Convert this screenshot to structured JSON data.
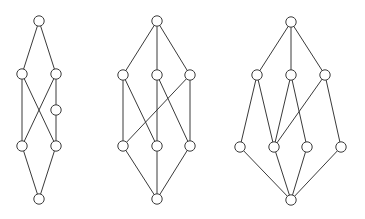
{
  "figure": {
    "node_radius": 5.2,
    "stroke_color": "#3a3a3a",
    "node_fill": "#ffffff",
    "background": "#ffffff"
  },
  "diagrams": [
    {
      "id": "lattice-1",
      "nodes": [
        {
          "id": "top",
          "x": 39,
          "y": 21
        },
        {
          "id": "a",
          "x": 22,
          "y": 74
        },
        {
          "id": "b",
          "x": 56,
          "y": 74
        },
        {
          "id": "c",
          "x": 56,
          "y": 110
        },
        {
          "id": "d",
          "x": 22,
          "y": 146
        },
        {
          "id": "e",
          "x": 56,
          "y": 146
        },
        {
          "id": "bottom",
          "x": 39,
          "y": 199
        }
      ],
      "edges": [
        [
          "top",
          "a"
        ],
        [
          "top",
          "b"
        ],
        [
          "a",
          "d"
        ],
        [
          "a",
          "e"
        ],
        [
          "b",
          "d"
        ],
        [
          "b",
          "c"
        ],
        [
          "c",
          "e"
        ],
        [
          "d",
          "bottom"
        ],
        [
          "e",
          "bottom"
        ]
      ]
    },
    {
      "id": "lattice-2",
      "nodes": [
        {
          "id": "top",
          "x": 157,
          "y": 21
        },
        {
          "id": "u1",
          "x": 123,
          "y": 75
        },
        {
          "id": "u2",
          "x": 157,
          "y": 75
        },
        {
          "id": "u3",
          "x": 190,
          "y": 75
        },
        {
          "id": "l1",
          "x": 123,
          "y": 146
        },
        {
          "id": "l2",
          "x": 157,
          "y": 146
        },
        {
          "id": "l3",
          "x": 190,
          "y": 146
        },
        {
          "id": "bottom",
          "x": 157,
          "y": 199
        }
      ],
      "edges": [
        [
          "top",
          "u1"
        ],
        [
          "top",
          "u2"
        ],
        [
          "top",
          "u3"
        ],
        [
          "u1",
          "l1"
        ],
        [
          "u1",
          "l2"
        ],
        [
          "u2",
          "l2"
        ],
        [
          "u2",
          "l3"
        ],
        [
          "u3",
          "l3"
        ],
        [
          "u3",
          "l1"
        ],
        [
          "l1",
          "bottom"
        ],
        [
          "l2",
          "bottom"
        ],
        [
          "l3",
          "bottom"
        ]
      ]
    },
    {
      "id": "lattice-3",
      "nodes": [
        {
          "id": "top",
          "x": 291,
          "y": 22
        },
        {
          "id": "u1",
          "x": 257,
          "y": 75
        },
        {
          "id": "u2",
          "x": 291,
          "y": 75
        },
        {
          "id": "u3",
          "x": 325,
          "y": 75
        },
        {
          "id": "l1",
          "x": 240,
          "y": 147
        },
        {
          "id": "l2",
          "x": 274,
          "y": 147
        },
        {
          "id": "l3",
          "x": 307,
          "y": 147
        },
        {
          "id": "l4",
          "x": 341,
          "y": 147
        },
        {
          "id": "bottom",
          "x": 291,
          "y": 200
        }
      ],
      "edges": [
        [
          "top",
          "u1"
        ],
        [
          "top",
          "u2"
        ],
        [
          "top",
          "u3"
        ],
        [
          "u1",
          "l1"
        ],
        [
          "u1",
          "l2"
        ],
        [
          "u2",
          "l2"
        ],
        [
          "u2",
          "l3"
        ],
        [
          "u3",
          "l2"
        ],
        [
          "u3",
          "l4"
        ],
        [
          "l1",
          "bottom"
        ],
        [
          "l2",
          "bottom"
        ],
        [
          "l3",
          "bottom"
        ],
        [
          "l4",
          "bottom"
        ]
      ]
    }
  ]
}
